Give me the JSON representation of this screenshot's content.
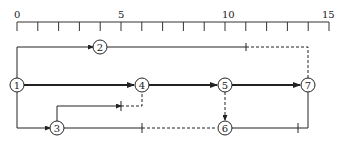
{
  "diagram": {
    "type": "time-scaled network diagram",
    "scale": {
      "min": 0,
      "max": 15,
      "step": 1,
      "labels": [
        {
          "value": 0,
          "text": "0"
        },
        {
          "value": 5,
          "text": "5"
        },
        {
          "value": 10,
          "text": "10"
        },
        {
          "value": 15,
          "text": "15"
        }
      ]
    },
    "nodes": [
      {
        "id": "1",
        "label": "1",
        "time": 0
      },
      {
        "id": "2",
        "label": "2",
        "time": 4
      },
      {
        "id": "3",
        "label": "3",
        "time": 2
      },
      {
        "id": "4",
        "label": "4",
        "time": 6
      },
      {
        "id": "5",
        "label": "5",
        "time": 10
      },
      {
        "id": "6",
        "label": "6",
        "time": 10
      },
      {
        "id": "7",
        "label": "7",
        "time": 14
      }
    ],
    "edges": [
      {
        "from": "1",
        "to": "2",
        "style": "solid",
        "bold": false
      },
      {
        "from": "1",
        "to": "4",
        "style": "solid",
        "bold": true
      },
      {
        "from": "1",
        "to": "3",
        "style": "solid",
        "bold": false
      },
      {
        "from": "2",
        "to": "7",
        "style": "solid-then-dashed",
        "free_float_from": 11
      },
      {
        "from": "3",
        "to": "4",
        "style": "solid-then-dashed",
        "free_float_from": 5
      },
      {
        "from": "3",
        "to": "6",
        "style": "solid-then-dashed",
        "free_float_from": 6
      },
      {
        "from": "4",
        "to": "5",
        "style": "solid",
        "bold": true
      },
      {
        "from": "5",
        "to": "7",
        "style": "solid",
        "bold": true
      },
      {
        "from": "5",
        "to": "6",
        "style": "dashed"
      },
      {
        "from": "6",
        "to": "7",
        "style": "solid",
        "free_float_from": 13.5
      }
    ]
  }
}
